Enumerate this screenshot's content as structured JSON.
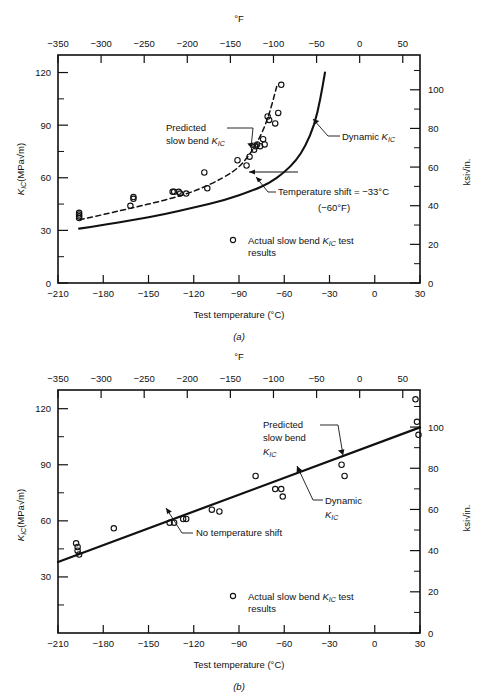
{
  "figure": {
    "panels": [
      {
        "id": "a",
        "label": "(a)",
        "top_axis": {
          "unit": "°F",
          "ticks": [
            "−350",
            "−300",
            "−250",
            "−200",
            "−150",
            "−100",
            "−50",
            "0",
            "50"
          ],
          "values": [
            -350,
            -300,
            -250,
            -200,
            -150,
            -100,
            -50,
            0,
            50
          ]
        },
        "bottom_axis": {
          "title": "Test temperature (°C)",
          "ticks": [
            "−210",
            "−180",
            "−150",
            "−120",
            "−90",
            "−60",
            "−30",
            "0",
            "30"
          ],
          "values": [
            -210,
            -180,
            -150,
            -120,
            -90,
            -60,
            -30,
            0,
            30
          ]
        },
        "left_axis": {
          "title_main": "K",
          "title_sub": "IC",
          "title_rest": "(MPa√m)",
          "ticks": [
            "0",
            "30",
            "60",
            "90",
            "120"
          ],
          "values": [
            0,
            30,
            60,
            90,
            120
          ],
          "minor_values": [
            15,
            45,
            75,
            105
          ]
        },
        "right_axis": {
          "title": "ksi√in.",
          "ticks": [
            "0",
            "20",
            "40",
            "60",
            "80",
            "100"
          ],
          "values": [
            0,
            20,
            40,
            60,
            80,
            100
          ]
        },
        "annotations": [
          {
            "name": "predicted-slow-bend",
            "line1": "Predicted",
            "line2_pre": "slow bend ",
            "line2_k": "K",
            "line2_sub": "IC"
          },
          {
            "name": "dynamic-kic",
            "pre": "Dynamic ",
            "k": "K",
            "sub": "IC"
          },
          {
            "name": "temperature-shift",
            "line1": "Temperature shift = −33°C",
            "line2": "(−60°F)"
          }
        ],
        "legend": {
          "marker": "open-circle",
          "line1_pre": "Actual slow bend ",
          "line1_k": "K",
          "line1_sub": "IC",
          "line1_post": " test",
          "line2": "results"
        }
      },
      {
        "id": "b",
        "label": "(b)",
        "top_axis": {
          "unit": "°F",
          "ticks": [
            "−350",
            "−300",
            "−250",
            "−200",
            "−150",
            "−100",
            "−50",
            "0",
            "50"
          ],
          "values": [
            -350,
            -300,
            -250,
            -200,
            -150,
            -100,
            -50,
            0,
            50
          ]
        },
        "bottom_axis": {
          "title": "Test temperature (°C)",
          "ticks": [
            "−210",
            "−180",
            "−150",
            "−120",
            "−90",
            "−60",
            "−30",
            "0",
            "30"
          ],
          "values": [
            -210,
            -180,
            -150,
            -120,
            -90,
            -60,
            -30,
            0,
            30
          ]
        },
        "left_axis": {
          "title_main": "K",
          "title_sub": "IC",
          "title_rest": "(MPa√m)",
          "ticks": [
            "30",
            "60",
            "90",
            "120"
          ],
          "values": [
            30,
            60,
            90,
            120
          ],
          "minor_values": [
            15,
            45,
            75,
            105
          ]
        },
        "right_axis": {
          "title": "ksi√in.",
          "ticks": [
            "0",
            "20",
            "40",
            "60",
            "80",
            "100"
          ],
          "values": [
            0,
            20,
            40,
            60,
            80,
            100
          ]
        },
        "annotations": [
          {
            "name": "predicted-slow-bend",
            "line1": "Predicted",
            "line2": "slow bend",
            "line3_k": "K",
            "line3_sub": "IC"
          },
          {
            "name": "dynamic-kic",
            "line1": "Dynamic",
            "line2_k": "K",
            "line2_sub": "IC"
          },
          {
            "name": "no-temperature-shift",
            "text": "No temperature shift"
          }
        ],
        "legend": {
          "marker": "open-circle",
          "line1_pre": "Actual slow bend ",
          "line1_k": "K",
          "line1_sub": "IC",
          "line1_post": " test",
          "line2": "results"
        }
      }
    ]
  },
  "chart_data": [
    {
      "type": "scatter",
      "panel": "a",
      "title": "",
      "xlabel": "Test temperature (°C)",
      "ylabel": "K_IC (MPa√m)",
      "xlim": [
        -210,
        30
      ],
      "ylim": [
        0,
        130
      ],
      "x2lim_degF": [
        -350,
        70
      ],
      "y2lim_ksi": [
        0,
        118
      ],
      "grid": false,
      "legend": "Actual slow bend K_IC test results",
      "series": [
        {
          "name": "Actual slow bend K_IC test results",
          "marker": "open-circle",
          "x": [
            -196,
            -196,
            -196,
            -196,
            -160,
            -160,
            -162,
            -134,
            -133,
            -130,
            -129,
            -125,
            -113,
            -111,
            -91,
            -85,
            -83,
            -80,
            -79,
            -78,
            -76,
            -74,
            -73,
            -71,
            -70,
            -66,
            -64,
            -62
          ],
          "y": [
            40,
            39,
            38,
            37,
            48,
            49,
            44,
            52,
            52,
            52,
            51,
            51,
            63,
            54,
            70,
            67,
            72,
            76,
            78,
            79,
            78,
            82,
            79,
            95,
            93,
            91,
            97,
            113
          ]
        },
        {
          "name": "Predicted slow bend K_IC",
          "style": "dashed",
          "x": [
            -196,
            -180,
            -160,
            -140,
            -120,
            -100,
            -90,
            -85,
            -80,
            -75,
            -70,
            -65
          ],
          "y": [
            36,
            39,
            43,
            47,
            52,
            60,
            66,
            71,
            77,
            85,
            96,
            112
          ]
        },
        {
          "name": "Dynamic K_IC",
          "style": "solid",
          "x": [
            -196,
            -180,
            -160,
            -140,
            -120,
            -100,
            -80,
            -70,
            -60,
            -52,
            -46,
            -40,
            -36,
            -33
          ],
          "y": [
            31,
            33,
            36,
            39,
            43,
            47,
            53,
            57,
            63,
            70,
            78,
            90,
            105,
            120
          ]
        }
      ],
      "annotations": [
        {
          "text": "Predicted slow bend K_IC",
          "points_to": [
            -81,
            76
          ]
        },
        {
          "text": "Dynamic K_IC",
          "points_to": [
            -41,
            95
          ]
        },
        {
          "text": "Temperature shift = −33°C (−60°F)",
          "points_to": [
            -74,
            68
          ]
        }
      ]
    },
    {
      "type": "scatter",
      "panel": "b",
      "title": "",
      "xlabel": "Test temperature (°C)",
      "ylabel": "K_IC (MPa√m)",
      "xlim": [
        -210,
        30
      ],
      "ylim": [
        0,
        130
      ],
      "x2lim_degF": [
        -350,
        70
      ],
      "y2lim_ksi": [
        0,
        118
      ],
      "grid": false,
      "legend": "Actual slow bend K_IC test results",
      "series": [
        {
          "name": "Actual slow bend K_IC test results",
          "marker": "open-circle",
          "x": [
            -198,
            -197,
            -197,
            -196,
            -173,
            -136,
            -133,
            -127,
            -125,
            -108,
            -103,
            -79,
            -66,
            -62,
            -61,
            -22,
            -20,
            27,
            28,
            29
          ],
          "y": [
            48,
            46,
            44,
            42,
            56,
            59,
            59,
            61,
            61,
            66,
            65,
            84,
            77,
            77,
            73,
            90,
            84,
            125,
            113,
            106
          ]
        },
        {
          "name": "Predicted slow bend K_IC / Dynamic K_IC (coincident)",
          "style": "solid",
          "x": [
            -210,
            30
          ],
          "y": [
            38,
            110
          ]
        }
      ],
      "annotations": [
        {
          "text": "Predicted slow bend K_IC",
          "points_to": [
            -22,
            93
          ]
        },
        {
          "text": "Dynamic K_IC",
          "points_to": [
            -63,
            76
          ]
        },
        {
          "text": "No temperature shift",
          "points_to": [
            -136,
            57
          ]
        }
      ]
    }
  ]
}
